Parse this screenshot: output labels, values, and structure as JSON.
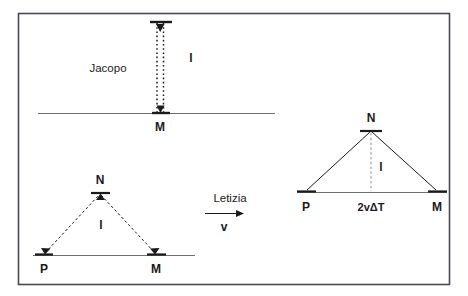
{
  "figure": {
    "frame": {
      "stroke": "#4a4a52",
      "fill": "#ffffff",
      "x": 18,
      "y": 13,
      "width": 432,
      "height": 272
    },
    "colors": {
      "ink": "#1a1a1a",
      "line": "#6e6e76",
      "frame": "#4a4a52",
      "background": "#ffffff"
    },
    "panels": [
      {
        "id": "jacopo-frame",
        "observer_label": "Jacopo",
        "observer_label_pos": {
          "x": 108,
          "y": 72
        },
        "ground_line": {
          "x1": 38,
          "y1": 113,
          "x2": 275,
          "y2": 113
        },
        "beam": {
          "type": "vertical-double-arrow",
          "x_left": 157,
          "x_right": 163,
          "y_top": 22,
          "y_bottom": 112,
          "style": "dotted"
        },
        "length_label": "l",
        "length_label_pos": {
          "x": 191,
          "y": 62
        },
        "point_labels": [
          {
            "text": "M",
            "x": 160,
            "y": 131
          }
        ]
      },
      {
        "id": "letizia-moving-frame-left-triangle",
        "base_line": {
          "x1": 33,
          "y1": 255,
          "x2": 195,
          "y2": 255
        },
        "apex": {
          "x": 100,
          "y": 193
        },
        "left_foot": {
          "x": 44,
          "y": 254
        },
        "right_foot": {
          "x": 156,
          "y": 254
        },
        "style": "dashed",
        "length_label": "l",
        "length_label_pos": {
          "x": 101,
          "y": 228
        },
        "point_labels": [
          {
            "text": "N",
            "x": 100,
            "y": 180
          },
          {
            "text": "P",
            "x": 44,
            "y": 272
          },
          {
            "text": "M",
            "x": 156,
            "y": 272
          }
        ]
      },
      {
        "id": "letizia-motion-indicator",
        "observer_label": "Letizia",
        "observer_label_pos": {
          "x": 230,
          "y": 200
        },
        "arrow": {
          "x1": 205,
          "y1": 213,
          "x2": 243,
          "y2": 213
        },
        "velocity_label": "v",
        "velocity_label_pos": {
          "x": 224,
          "y": 229
        }
      },
      {
        "id": "letizia-frame-right-triangle",
        "base_line": {
          "x1": 297,
          "y1": 192,
          "x2": 447,
          "y2": 192
        },
        "apex": {
          "x": 371,
          "y": 130
        },
        "left_foot": {
          "x": 306,
          "y": 191
        },
        "right_foot": {
          "x": 437,
          "y": 191
        },
        "style": "solid",
        "height_line": {
          "x": 371,
          "y_top": 132,
          "y_bottom": 191,
          "style": "dashed"
        },
        "length_label": "l",
        "length_label_pos": {
          "x": 381,
          "y": 168
        },
        "base_label": "2vΔT",
        "base_label_pos": {
          "x": 371,
          "y": 209
        },
        "point_labels": [
          {
            "text": "N",
            "x": 371,
            "y": 119
          },
          {
            "text": "P",
            "x": 306,
            "y": 209
          },
          {
            "text": "M",
            "x": 437,
            "y": 209
          }
        ]
      }
    ]
  }
}
